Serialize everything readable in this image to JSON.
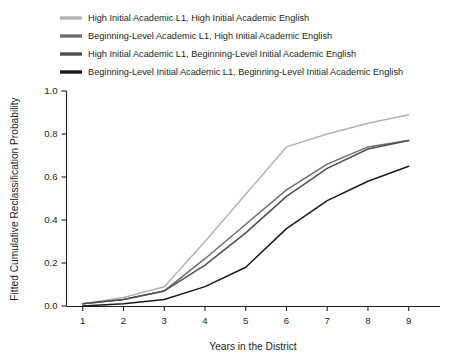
{
  "chart_data": {
    "type": "line",
    "title": "",
    "xlabel": "Years in the District",
    "ylabel": "Fitted Cumulative Reclassification Probability",
    "x": [
      1,
      2,
      3,
      4,
      5,
      6,
      7,
      8,
      9
    ],
    "xlim": [
      0.6,
      9.4
    ],
    "ylim": [
      0.0,
      1.0
    ],
    "xticks": [
      "1",
      "2",
      "3",
      "4",
      "5",
      "6",
      "7",
      "8",
      "9"
    ],
    "yticks": [
      "0.0",
      "0.2",
      "0.4",
      "0.6",
      "0.8",
      "1.0"
    ],
    "ytick_values": [
      0.0,
      0.2,
      0.4,
      0.6,
      0.8,
      1.0
    ],
    "grid": false,
    "legend_position": "above-plot",
    "series": [
      {
        "name": "High Initial Academic L1, High Initial Academic English",
        "color": "#b4b4b4",
        "values": [
          0.01,
          0.04,
          0.09,
          0.3,
          0.52,
          0.74,
          0.8,
          0.85,
          0.89
        ]
      },
      {
        "name": "Beginning-Level Academic L1, High Initial Academic English",
        "color": "#6e6e6e",
        "values": [
          0.01,
          0.03,
          0.07,
          0.22,
          0.38,
          0.54,
          0.66,
          0.74,
          0.77
        ]
      },
      {
        "name": "High Initial Academic L1, Beginning-Level Initial Academic English",
        "color": "#4f4f4f",
        "values": [
          0.01,
          0.03,
          0.07,
          0.19,
          0.34,
          0.51,
          0.64,
          0.73,
          0.77
        ]
      },
      {
        "name": "Beginning-Level Initial Academic L1, Beginning-Level Initial Academic English",
        "color": "#1a1a1a",
        "values": [
          0.0,
          0.01,
          0.03,
          0.09,
          0.18,
          0.36,
          0.49,
          0.58,
          0.65
        ]
      }
    ]
  }
}
